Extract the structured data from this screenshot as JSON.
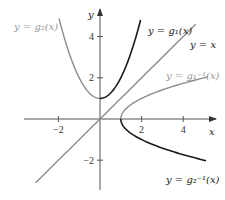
{
  "diagram": {
    "type": "function-graph",
    "axes": {
      "x_label": "x",
      "y_label": "y",
      "x_range": [
        -3.7,
        5.6
      ],
      "y_range": [
        -3.4,
        5.4
      ],
      "x_ticks": [
        {
          "value": -2,
          "label": "−2"
        },
        {
          "value": 2,
          "label": "2"
        },
        {
          "value": 4,
          "label": "4"
        }
      ],
      "y_ticks": [
        {
          "value": -2,
          "label": "−2"
        },
        {
          "value": 2,
          "label": "2"
        },
        {
          "value": 4,
          "label": "4"
        }
      ]
    },
    "colors": {
      "dark": "#1a1a1a",
      "gray": "#8c8c8c",
      "axis": "#555555",
      "label_gray": "#999999",
      "label_dark": "#222222"
    },
    "curves": [
      {
        "name": "g1",
        "expression": "x^2 + 1",
        "domain": [
          0,
          1.95
        ],
        "color_key": "dark",
        "label": "y = g₁(x)"
      },
      {
        "name": "g2",
        "expression": "x^2 + 1",
        "domain": [
          -1.97,
          0
        ],
        "color_key": "gray",
        "label": "y = g₂(x)"
      },
      {
        "name": "identity",
        "expression": "x",
        "domain": [
          -3.1,
          4.6
        ],
        "color_key": "gray",
        "label": "y = x"
      },
      {
        "name": "g1-inverse",
        "expression": "sqrt(x - 1)",
        "domain": [
          1,
          5.2
        ],
        "color_key": "gray",
        "label": "y = g₁⁻¹(x)"
      },
      {
        "name": "g2-inverse",
        "expression": "-sqrt(x - 1)",
        "domain": [
          1,
          5.1
        ],
        "color_key": "dark",
        "label": "y = g₂⁻¹(x)"
      }
    ]
  }
}
